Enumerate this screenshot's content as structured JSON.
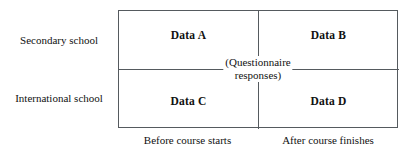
{
  "diagram": {
    "type": "2x2-matrix",
    "center_caption": {
      "line1": "(Questionnaire",
      "line2": "responses)"
    },
    "row_labels": [
      {
        "id": "secondary",
        "label": "Secondary school"
      },
      {
        "id": "international",
        "label": "International school"
      }
    ],
    "column_labels": [
      {
        "id": "before",
        "label": "Before course starts"
      },
      {
        "id": "after",
        "label": "After course finishes"
      }
    ],
    "cells": [
      {
        "id": "a",
        "label": "Data A",
        "row": "secondary",
        "column": "before"
      },
      {
        "id": "b",
        "label": "Data B",
        "row": "secondary",
        "column": "after"
      },
      {
        "id": "c",
        "label": "Data C",
        "row": "international",
        "column": "before"
      },
      {
        "id": "d",
        "label": "Data D",
        "row": "international",
        "column": "after"
      }
    ],
    "colors": {
      "border": "#555a5e",
      "text": "#111111",
      "background": "#ffffff"
    }
  }
}
